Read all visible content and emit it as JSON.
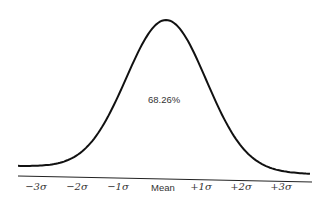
{
  "chart_data": {
    "type": "line",
    "title": "",
    "xlabel": "",
    "ylabel": "",
    "x_tick_labels": [
      "−3σ",
      "−2σ",
      "−1σ",
      "Mean",
      "+1σ",
      "+2σ",
      "+3σ"
    ],
    "x": [
      -3,
      -2,
      -1,
      0,
      1,
      2,
      3
    ],
    "values": [
      0.0044,
      0.054,
      0.242,
      0.399,
      0.242,
      0.054,
      0.0044
    ],
    "annotations": [
      {
        "text": "68.26%",
        "position": "center under curve"
      }
    ],
    "grid": false,
    "legend": null
  },
  "labels": {
    "ticks": [
      "−3σ",
      "−2σ",
      "−1σ",
      "Mean",
      "+1σ",
      "+2σ",
      "+3σ"
    ],
    "area": "68.26%"
  }
}
